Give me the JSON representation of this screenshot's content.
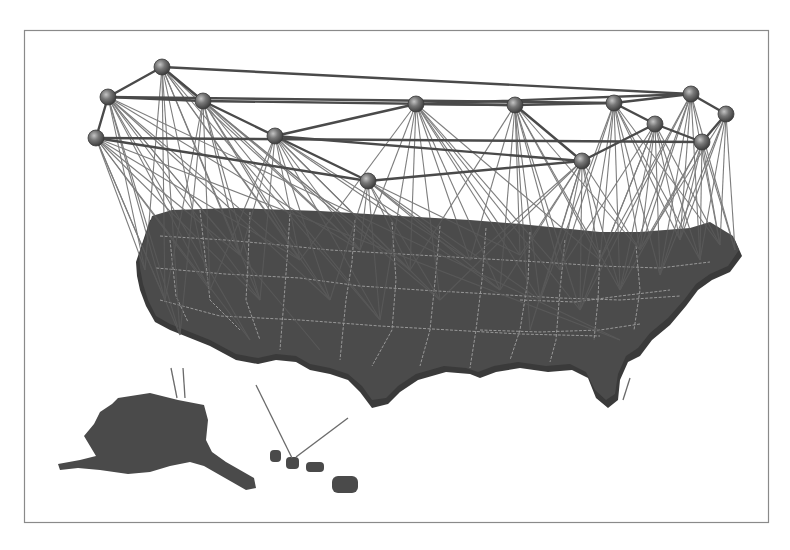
{
  "figure": {
    "type": "3d-geographic-network-visualization",
    "frame": {
      "x": 24,
      "y": 30,
      "width": 744,
      "height": 492,
      "stroke": "#8a8a8a"
    },
    "colors": {
      "background": "#ffffff",
      "land": "#4a4a4a",
      "land_shadow": "#3a3a3a",
      "state_borders": "#a8a8a8",
      "links": "#5a5a5a",
      "node_fill": "#6a6a6a",
      "node_highlight": "#bdbdbd"
    },
    "nodes": [
      {
        "id": 0,
        "x": 162,
        "y": 67
      },
      {
        "id": 1,
        "x": 108,
        "y": 97
      },
      {
        "id": 2,
        "x": 96,
        "y": 138
      },
      {
        "id": 3,
        "x": 203,
        "y": 101
      },
      {
        "id": 4,
        "x": 275,
        "y": 136
      },
      {
        "id": 5,
        "x": 368,
        "y": 181
      },
      {
        "id": 6,
        "x": 416,
        "y": 104
      },
      {
        "id": 7,
        "x": 515,
        "y": 105
      },
      {
        "id": 8,
        "x": 614,
        "y": 103
      },
      {
        "id": 9,
        "x": 691,
        "y": 94
      },
      {
        "id": 10,
        "x": 726,
        "y": 114
      },
      {
        "id": 11,
        "x": 655,
        "y": 124
      },
      {
        "id": 12,
        "x": 582,
        "y": 161
      },
      {
        "id": 13,
        "x": 702,
        "y": 142
      }
    ],
    "backbone_links": [
      [
        0,
        1
      ],
      [
        0,
        3
      ],
      [
        0,
        9
      ],
      [
        1,
        2
      ],
      [
        1,
        3
      ],
      [
        1,
        8
      ],
      [
        2,
        13
      ],
      [
        3,
        4
      ],
      [
        3,
        7
      ],
      [
        4,
        5
      ],
      [
        4,
        6
      ],
      [
        6,
        7
      ],
      [
        7,
        8
      ],
      [
        8,
        9
      ],
      [
        9,
        10
      ],
      [
        8,
        11
      ],
      [
        5,
        12
      ],
      [
        12,
        11
      ],
      [
        11,
        13
      ],
      [
        10,
        13
      ],
      [
        6,
        9
      ],
      [
        2,
        5
      ],
      [
        4,
        12
      ],
      [
        7,
        12
      ]
    ],
    "ground_points": [
      [
        145,
        270
      ],
      [
        165,
        300
      ],
      [
        180,
        335
      ],
      [
        210,
        290
      ],
      [
        240,
        255
      ],
      [
        260,
        300
      ],
      [
        300,
        260
      ],
      [
        330,
        300
      ],
      [
        360,
        250
      ],
      [
        380,
        320
      ],
      [
        410,
        270
      ],
      [
        440,
        300
      ],
      [
        470,
        260
      ],
      [
        500,
        290
      ],
      [
        520,
        255
      ],
      [
        540,
        300
      ],
      [
        560,
        270
      ],
      [
        580,
        310
      ],
      [
        600,
        260
      ],
      [
        620,
        290
      ],
      [
        640,
        250
      ],
      [
        660,
        275
      ],
      [
        680,
        240
      ],
      [
        700,
        260
      ],
      [
        720,
        245
      ],
      [
        735,
        250
      ],
      [
        530,
        330
      ],
      [
        470,
        350
      ],
      [
        400,
        360
      ],
      [
        320,
        350
      ],
      [
        250,
        340
      ],
      [
        620,
        340
      ],
      [
        590,
        380
      ],
      [
        505,
        380
      ],
      [
        440,
        400
      ],
      [
        290,
        395
      ]
    ],
    "fan_links": [
      {
        "node": 0,
        "targets": [
          0,
          1,
          2,
          3,
          4,
          5,
          6,
          7,
          8,
          9,
          10
        ]
      },
      {
        "node": 1,
        "targets": [
          0,
          1,
          2,
          3,
          4,
          5,
          6,
          7,
          8,
          29,
          30,
          31
        ]
      },
      {
        "node": 2,
        "targets": [
          0,
          1,
          2,
          3,
          4,
          5,
          6,
          30,
          31
        ]
      },
      {
        "node": 3,
        "targets": [
          1,
          2,
          3,
          4,
          5,
          6,
          7,
          8,
          9,
          10,
          11
        ]
      },
      {
        "node": 4,
        "targets": [
          3,
          4,
          5,
          6,
          7,
          8,
          9,
          10,
          11,
          12,
          13
        ]
      },
      {
        "node": 5,
        "targets": [
          7,
          8,
          9,
          10,
          11,
          12,
          13,
          14,
          15
        ]
      },
      {
        "node": 6,
        "targets": [
          6,
          8,
          9,
          10,
          11,
          12,
          13,
          14,
          15,
          16,
          17,
          18
        ]
      },
      {
        "node": 7,
        "targets": [
          10,
          12,
          13,
          14,
          15,
          16,
          17,
          18,
          19,
          20,
          26
        ]
      },
      {
        "node": 8,
        "targets": [
          15,
          16,
          17,
          18,
          19,
          20,
          21,
          22,
          23,
          24
        ]
      },
      {
        "node": 9,
        "targets": [
          17,
          18,
          19,
          20,
          21,
          22,
          23,
          24,
          25
        ]
      },
      {
        "node": 10,
        "targets": [
          20,
          21,
          22,
          23,
          24,
          25
        ]
      },
      {
        "node": 11,
        "targets": [
          16,
          17,
          18,
          19,
          20,
          21,
          22,
          23,
          24
        ]
      },
      {
        "node": 12,
        "targets": [
          11,
          12,
          13,
          14,
          15,
          16,
          17,
          18,
          19,
          20,
          26
        ]
      },
      {
        "node": 13,
        "targets": [
          19,
          20,
          21,
          22,
          23,
          24,
          25
        ]
      }
    ],
    "offshore_links": [
      {
        "from": [
          171,
          368
        ],
        "to": [
          177,
          398
        ]
      },
      {
        "from": [
          183,
          368
        ],
        "to": [
          185,
          398
        ]
      },
      {
        "from": [
          256,
          385
        ],
        "to": [
          292,
          458
        ]
      },
      {
        "from": [
          348,
          418
        ],
        "to": [
          296,
          457
        ]
      },
      {
        "from": [
          630,
          378
        ],
        "to": [
          623,
          400
        ]
      }
    ]
  }
}
